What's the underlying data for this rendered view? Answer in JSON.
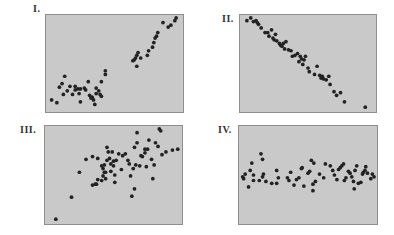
{
  "colors": {
    "panel_bg": "#c9c9c9",
    "panel_border": "#8e8e8e",
    "dot": "#222222",
    "label": "#333333"
  },
  "chart_data": [
    {
      "type": "scatter",
      "title": "I.",
      "xlabel": "",
      "ylabel": "",
      "xlim": [
        0,
        100
      ],
      "ylim": [
        0,
        100
      ],
      "grid": false,
      "description": "Nonlinear (curved) positive relationship",
      "points": [
        [
          2,
          10
        ],
        [
          6,
          7
        ],
        [
          8,
          24
        ],
        [
          10,
          28
        ],
        [
          11,
          16
        ],
        [
          12,
          36
        ],
        [
          14,
          20
        ],
        [
          16,
          25
        ],
        [
          18,
          16
        ],
        [
          20,
          25
        ],
        [
          20,
          21
        ],
        [
          22,
          22
        ],
        [
          23,
          17
        ],
        [
          24,
          22
        ],
        [
          24,
          8
        ],
        [
          27,
          23
        ],
        [
          28,
          21
        ],
        [
          30,
          30
        ],
        [
          31,
          15
        ],
        [
          32,
          12
        ],
        [
          33,
          13
        ],
        [
          34,
          10
        ],
        [
          35,
          5
        ],
        [
          36,
          17
        ],
        [
          36,
          23
        ],
        [
          38,
          20
        ],
        [
          39,
          16
        ],
        [
          40,
          14
        ],
        [
          40,
          30
        ],
        [
          43,
          38
        ],
        [
          43,
          42
        ],
        [
          64,
          53
        ],
        [
          65,
          54
        ],
        [
          66,
          56
        ],
        [
          67,
          59
        ],
        [
          67,
          47
        ],
        [
          68,
          62
        ],
        [
          70,
          56
        ],
        [
          75,
          59
        ],
        [
          76,
          64
        ],
        [
          79,
          68
        ],
        [
          80,
          73
        ],
        [
          81,
          78
        ],
        [
          82,
          80
        ],
        [
          83,
          84
        ],
        [
          87,
          95
        ],
        [
          91,
          90
        ],
        [
          93,
          92
        ],
        [
          96,
          97
        ],
        [
          97,
          101
        ]
      ]
    },
    {
      "type": "scatter",
      "title": "II.",
      "xlabel": "",
      "ylabel": "",
      "xlim": [
        0,
        100
      ],
      "ylim": [
        0,
        100
      ],
      "grid": false,
      "description": "Strong negative linear relationship",
      "points": [
        [
          3,
          97
        ],
        [
          6,
          100
        ],
        [
          8,
          96
        ],
        [
          10,
          97
        ],
        [
          11,
          95
        ],
        [
          12,
          93
        ],
        [
          14,
          89
        ],
        [
          17,
          84
        ],
        [
          19,
          84
        ],
        [
          20,
          80
        ],
        [
          22,
          87
        ],
        [
          23,
          78
        ],
        [
          24,
          76
        ],
        [
          25,
          82
        ],
        [
          26,
          75
        ],
        [
          28,
          72
        ],
        [
          29,
          70
        ],
        [
          30,
          69
        ],
        [
          31,
          72
        ],
        [
          32,
          66
        ],
        [
          33,
          74
        ],
        [
          35,
          65
        ],
        [
          37,
          64
        ],
        [
          38,
          58
        ],
        [
          40,
          59
        ],
        [
          42,
          61
        ],
        [
          43,
          52
        ],
        [
          44,
          58
        ],
        [
          45,
          55
        ],
        [
          46,
          49
        ],
        [
          47,
          54
        ],
        [
          48,
          58
        ],
        [
          50,
          45
        ],
        [
          51,
          41
        ],
        [
          55,
          38
        ],
        [
          57,
          47
        ],
        [
          59,
          37
        ],
        [
          60,
          34
        ],
        [
          61,
          36
        ],
        [
          62,
          33
        ],
        [
          64,
          32
        ],
        [
          66,
          36
        ],
        [
          67,
          27
        ],
        [
          70,
          19
        ],
        [
          72,
          15
        ],
        [
          75,
          18
        ],
        [
          78,
          8
        ],
        [
          94,
          2
        ]
      ]
    },
    {
      "type": "scatter",
      "title": "III.",
      "xlabel": "",
      "ylabel": "",
      "xlim": [
        0,
        100
      ],
      "ylim": [
        0,
        100
      ],
      "grid": false,
      "description": "Weak positive relationship with large scatter",
      "points": [
        [
          6,
          2
        ],
        [
          18,
          26
        ],
        [
          24,
          53
        ],
        [
          29,
          67
        ],
        [
          34,
          70
        ],
        [
          34,
          39
        ],
        [
          36,
          40
        ],
        [
          37,
          40
        ],
        [
          38,
          45
        ],
        [
          38,
          68
        ],
        [
          41,
          60
        ],
        [
          41,
          44
        ],
        [
          42,
          57
        ],
        [
          42,
          49
        ],
        [
          43,
          53
        ],
        [
          43,
          61
        ],
        [
          44,
          53
        ],
        [
          44,
          46
        ],
        [
          45,
          66
        ],
        [
          45,
          80
        ],
        [
          46,
          75
        ],
        [
          47,
          68
        ],
        [
          48,
          54
        ],
        [
          48,
          62
        ],
        [
          49,
          75
        ],
        [
          50,
          65
        ],
        [
          50,
          60
        ],
        [
          51,
          50
        ],
        [
          52,
          66
        ],
        [
          51,
          42
        ],
        [
          54,
          73
        ],
        [
          56,
          56
        ],
        [
          57,
          71
        ],
        [
          59,
          73
        ],
        [
          61,
          66
        ],
        [
          62,
          62
        ],
        [
          63,
          49
        ],
        [
          64,
          27
        ],
        [
          65,
          57
        ],
        [
          66,
          35
        ],
        [
          66,
          80
        ],
        [
          67,
          61
        ],
        [
          68,
          96
        ],
        [
          68,
          85
        ],
        [
          70,
          60
        ],
        [
          71,
          71
        ],
        [
          72,
          70
        ],
        [
          74,
          78
        ],
        [
          74,
          74
        ],
        [
          75,
          59
        ],
        [
          76,
          78
        ],
        [
          77,
          88
        ],
        [
          79,
          67
        ],
        [
          80,
          46
        ],
        [
          81,
          61
        ],
        [
          82,
          85
        ],
        [
          84,
          81
        ],
        [
          85,
          100
        ],
        [
          86,
          98
        ],
        [
          87,
          72
        ],
        [
          90,
          75
        ],
        [
          95,
          77
        ],
        [
          99,
          78
        ]
      ]
    },
    {
      "type": "scatter",
      "title": "IV.",
      "xlabel": "",
      "ylabel": "",
      "xlim": [
        0,
        100
      ],
      "ylim": [
        0,
        100
      ],
      "grid": false,
      "description": "No relationship (horizontal scatter)",
      "points": [
        [
          1,
          48
        ],
        [
          2,
          46
        ],
        [
          4,
          51
        ],
        [
          8,
          37
        ],
        [
          10,
          55
        ],
        [
          12,
          63
        ],
        [
          14,
          50
        ],
        [
          14,
          44
        ],
        [
          21,
          44
        ],
        [
          23,
          73
        ],
        [
          25,
          67
        ],
        [
          25,
          48
        ],
        [
          26,
          51
        ],
        [
          29,
          43
        ],
        [
          36,
          41
        ],
        [
          42,
          41
        ],
        [
          42,
          55
        ],
        [
          44,
          47
        ],
        [
          55,
          47
        ],
        [
          57,
          44
        ],
        [
          59,
          53
        ],
        [
          63,
          39
        ],
        [
          66,
          45
        ],
        [
          69,
          47
        ],
        [
          72,
          57
        ],
        [
          73,
          58
        ],
        [
          75,
          38
        ],
        [
          80,
          52
        ],
        [
          84,
          66
        ],
        [
          86,
          33
        ],
        [
          86,
          40
        ],
        [
          82,
          54
        ],
        [
          87,
          63
        ],
        [
          89,
          43
        ],
        [
          94,
          51
        ],
        [
          99,
          47
        ],
        [
          101,
          62
        ],
        [
          107,
          60
        ],
        [
          110,
          55
        ],
        [
          112,
          50
        ],
        [
          115,
          45
        ],
        [
          117,
          56
        ],
        [
          119,
          58
        ],
        [
          121,
          60
        ],
        [
          123,
          62
        ],
        [
          124,
          44
        ],
        [
          126,
          47
        ],
        [
          129,
          54
        ],
        [
          131,
          52
        ],
        [
          133,
          48
        ],
        [
          135,
          43
        ],
        [
          136,
          35
        ],
        [
          137,
          55
        ],
        [
          139,
          60
        ],
        [
          141,
          41
        ],
        [
          144,
          42
        ],
        [
          146,
          51
        ],
        [
          147,
          53
        ],
        [
          149,
          55
        ],
        [
          150,
          59
        ],
        [
          152,
          52
        ],
        [
          156,
          46
        ],
        [
          158,
          51
        ],
        [
          160,
          48
        ]
      ]
    }
  ],
  "panels": [
    {
      "label": "I."
    },
    {
      "label": "II."
    },
    {
      "label": "III."
    },
    {
      "label": "IV."
    }
  ]
}
